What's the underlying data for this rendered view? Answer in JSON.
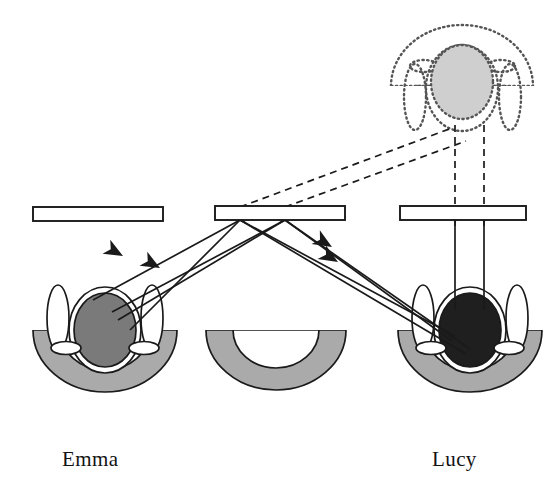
{
  "figure": {
    "title_visible": false,
    "background_color": "#ffffff",
    "stroke_color": "#1a1a1a",
    "labels": [
      {
        "id": "label-emma",
        "text": "Emma",
        "x": 62,
        "y": 466
      },
      {
        "id": "label-lucy",
        "text": "Lucy",
        "x": 432,
        "y": 466
      }
    ],
    "colors": {
      "outline": "#1a1a1a",
      "bar_fill": "#ffffff",
      "shell_gray": "#aaaaaa",
      "emma_center_gray": "#7a7a7a",
      "lucy_center_black": "#1f1f1f",
      "ghost_center_gray": "#cfcfcf",
      "ghost_outline": "#555555",
      "white": "#ffffff"
    },
    "bars": [
      {
        "id": "bar-left",
        "x": 33,
        "y": 207,
        "width": 130,
        "height": 14,
        "fill": "#ffffff",
        "stroke": "#1a1a1a"
      },
      {
        "id": "bar-middle",
        "x": 215,
        "y": 206,
        "width": 130,
        "height": 14,
        "fill": "#ffffff",
        "stroke": "#1a1a1a"
      },
      {
        "id": "bar-right",
        "x": 400,
        "y": 206,
        "width": 126,
        "height": 14,
        "fill": "#ffffff",
        "stroke": "#1a1a1a"
      }
    ],
    "subjects": [
      {
        "id": "subject-emma",
        "name": "Emma",
        "center_x": 105,
        "center_y": 330,
        "center_ellipse_fill": "#7a7a7a",
        "orientation": "upright",
        "line_style": "solid"
      },
      {
        "id": "subject-lucy",
        "name": "Lucy",
        "center_x": 470,
        "center_y": 330,
        "center_ellipse_fill": "#1f1f1f",
        "orientation": "upright",
        "line_style": "solid"
      },
      {
        "id": "subject-empty-middle",
        "name": "",
        "center_x": 275,
        "center_y": 330,
        "center_ellipse_fill": "none",
        "orientation": "upright",
        "line_style": "solid",
        "shell_only": true
      },
      {
        "id": "subject-virtual-image",
        "name": "",
        "center_x": 462,
        "center_y": 82,
        "center_ellipse_fill": "#cfcfcf",
        "orientation": "inverted",
        "line_style": "dotted"
      }
    ],
    "rays": [
      {
        "id": "ray-lucy-to-emma-outer",
        "style": "solid",
        "arrow": "mid",
        "from": [
          455,
          335
        ],
        "via": [
          240,
          220
        ],
        "to": [
          95,
          298
        ]
      },
      {
        "id": "ray-lucy-to-emma-inner",
        "style": "solid",
        "arrow": "mid",
        "from": [
          470,
          348
        ],
        "via": [
          285,
          220
        ],
        "to": [
          110,
          308
        ]
      },
      {
        "id": "ray-emma-to-lucy-outer",
        "style": "solid",
        "arrow": "mid",
        "from": [
          118,
          318
        ],
        "via": [
          285,
          220
        ],
        "to": [
          452,
          340
        ]
      },
      {
        "id": "ray-emma-to-lucy-inner",
        "style": "solid",
        "arrow": "mid",
        "from": [
          128,
          327
        ],
        "via": [
          240,
          220
        ],
        "to": [
          466,
          352
        ]
      },
      {
        "id": "ray-vertical-left",
        "style": "solid",
        "arrow": "up",
        "from": [
          455,
          300
        ],
        "to": [
          455,
          214
        ]
      },
      {
        "id": "ray-vertical-right",
        "style": "solid",
        "arrow": "up",
        "from": [
          484,
          300
        ],
        "to": [
          484,
          214
        ]
      },
      {
        "id": "ray-dashed-vertical-left",
        "style": "dashed",
        "from": [
          455,
          206
        ],
        "to": [
          455,
          122
        ]
      },
      {
        "id": "ray-dashed-vertical-right",
        "style": "dashed",
        "from": [
          484,
          206
        ],
        "to": [
          484,
          122
        ]
      },
      {
        "id": "ray-dashed-diag-upper",
        "style": "dashed",
        "from": [
          240,
          207
        ],
        "to": [
          452,
          128
        ]
      },
      {
        "id": "ray-dashed-diag-lower",
        "style": "dashed",
        "from": [
          285,
          207
        ],
        "to": [
          466,
          140
        ]
      }
    ]
  }
}
